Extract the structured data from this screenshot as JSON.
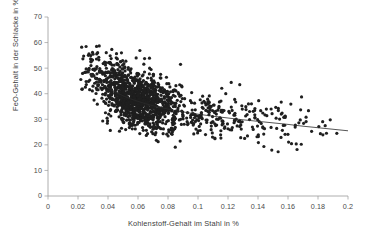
{
  "chart_data": {
    "type": "scatter",
    "title": "",
    "xlabel": "Kohlenstoff-Gehalt im Stahl in %",
    "ylabel": "FeO-Gehalt in der Schlacke in %",
    "xlim": [
      0,
      0.2
    ],
    "ylim": [
      0,
      70
    ],
    "xticks": [
      "0",
      "0.02",
      "0.04",
      "0.06",
      "0.08",
      "0.1",
      "0.12",
      "0.14",
      "0.16",
      "0.18",
      "0.2"
    ],
    "xtick_values": [
      0,
      0.02,
      0.04,
      0.06,
      0.08,
      0.1,
      0.12,
      0.14,
      0.16,
      0.18,
      0.2
    ],
    "yticks": [
      "0",
      "10",
      "20",
      "30",
      "40",
      "50",
      "60",
      "70"
    ],
    "ytick_values": [
      0,
      10,
      20,
      30,
      40,
      50,
      60,
      70
    ],
    "grid": false,
    "legend": "none",
    "marker": {
      "shape": "circle",
      "color": "#1f1f1f",
      "size": 1.6
    },
    "axis_color": "#9a9a9a",
    "background": "#ffffff",
    "n_points": 1500,
    "trendline": {
      "type": "power-decay",
      "color": "#2b2b2b",
      "width": 0.8,
      "x_start": 0.0255,
      "x_end": 0.2,
      "points": [
        [
          0.0255,
          49.5
        ],
        [
          0.03,
          46.8
        ],
        [
          0.035,
          44.3
        ],
        [
          0.04,
          42.3
        ],
        [
          0.045,
          40.6
        ],
        [
          0.05,
          39.2
        ],
        [
          0.055,
          38.0
        ],
        [
          0.06,
          37.0
        ],
        [
          0.065,
          36.1
        ],
        [
          0.07,
          35.3
        ],
        [
          0.075,
          34.6
        ],
        [
          0.08,
          34.0
        ],
        [
          0.085,
          33.4
        ],
        [
          0.09,
          32.9
        ],
        [
          0.095,
          32.4
        ],
        [
          0.1,
          32.0
        ],
        [
          0.11,
          31.2
        ],
        [
          0.12,
          30.5
        ],
        [
          0.13,
          29.8
        ],
        [
          0.14,
          29.2
        ],
        [
          0.15,
          28.6
        ],
        [
          0.16,
          28.0
        ],
        [
          0.17,
          27.3
        ],
        [
          0.18,
          26.7
        ],
        [
          0.19,
          26.1
        ],
        [
          0.2,
          25.5
        ]
      ]
    },
    "cluster_description": {
      "x_range_main": [
        0.022,
        0.2
      ],
      "y_range_main": [
        16,
        61
      ],
      "core_x": [
        0.04,
        0.09
      ],
      "core_y": [
        30,
        48
      ],
      "relationship": "negative / decreasing FeO with increasing carbon"
    },
    "scatter_seed": 20250411
  }
}
